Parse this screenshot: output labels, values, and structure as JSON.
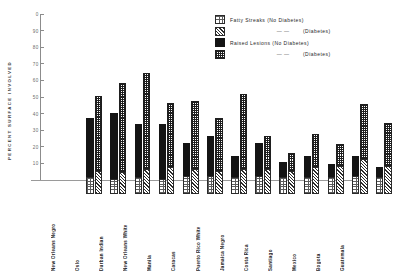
{
  "axis": {
    "ylabel": "PERCENT  SURFACE  INVOLVED",
    "ticks": [
      "0",
      "90",
      "80",
      "70",
      "60",
      "50",
      "40",
      "30",
      "20",
      "10"
    ]
  },
  "legend": {
    "items": [
      {
        "swatch": "dotted-swatch",
        "label": "Fatty Streaks (No Diabetes)"
      },
      {
        "swatch": "hatched-swatch",
        "label": "(Diabetes)",
        "indent": true,
        "dash": "—        —"
      },
      {
        "swatch": "solid-swatch",
        "label": "Raised Lesions (No Diabetes)"
      },
      {
        "swatch": "checkered-swatch",
        "label": "(Diabetes)",
        "indent": true,
        "dash": "—        —"
      }
    ]
  },
  "chart_data": {
    "type": "bar",
    "title": "",
    "xlabel": "",
    "ylabel": "PERCENT SURFACE INVOLVED",
    "ylim": [
      0,
      100
    ],
    "grid": false,
    "legend_position": "top-right",
    "stacked": true,
    "grouped": true,
    "categories": [
      "New Orleans Negro",
      "Oslo",
      "Durban Indian",
      "New Orleans White",
      "Manila",
      "Caracas",
      "Puerto Rico White",
      "Jamaica Negro",
      "Costa Rica",
      "Santiago",
      "Mexico",
      "Bogota",
      "Guatemala"
    ],
    "series": [
      {
        "name": "Fatty Streaks (No Diabetes)",
        "group": "No Diabetes",
        "stack_part": "bottom",
        "values": [
          10,
          9,
          10,
          9,
          11,
          11,
          10,
          11,
          10,
          10,
          10,
          11,
          10
        ]
      },
      {
        "name": "Raised Lesions (No Diabetes)",
        "group": "No Diabetes",
        "stack_part": "top",
        "values": [
          36,
          40,
          32,
          33,
          20,
          24,
          13,
          20,
          9,
          13,
          8,
          12,
          6
        ]
      },
      {
        "name": "Fatty Streaks (Diabetes)",
        "group": "Diabetes",
        "stack_part": "bottom",
        "values": [
          14,
          13,
          15,
          16,
          15,
          14,
          15,
          15,
          14,
          16,
          17,
          21,
          17
        ]
      },
      {
        "name": "Raised Lesions (Diabetes)",
        "group": "Diabetes",
        "stack_part": "top",
        "values": [
          45,
          54,
          58,
          39,
          41,
          32,
          45,
          20,
          11,
          20,
          13,
          33,
          26
        ]
      }
    ],
    "totals": {
      "no_diabetes": [
        46,
        49,
        42,
        42,
        31,
        35,
        23,
        31,
        19,
        23,
        18,
        23,
        16
      ],
      "diabetes": [
        59,
        67,
        73,
        55,
        56,
        46,
        60,
        35,
        25,
        36,
        30,
        54,
        43
      ]
    }
  }
}
